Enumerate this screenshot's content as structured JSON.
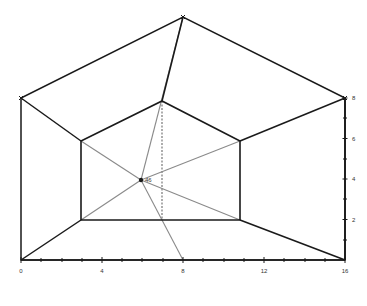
{
  "diagram": {
    "type": "perspective-pentagonal-frustum",
    "colors": {
      "stroke_main": "#1a1a1a",
      "stroke_guide": "#8a8a8a",
      "background": "#ffffff",
      "label": "#333333"
    },
    "outer_pentagon": [
      [
        21,
        260
      ],
      [
        21,
        98
      ],
      [
        183,
        17
      ],
      [
        345,
        98
      ],
      [
        345,
        260
      ]
    ],
    "inner_pentagon": [
      [
        81,
        220
      ],
      [
        81,
        141
      ],
      [
        162,
        101
      ],
      [
        240,
        141
      ],
      [
        240,
        220
      ]
    ],
    "center_point": {
      "x": 141,
      "y": 180,
      "label": "46"
    },
    "x_axis": {
      "y": 260,
      "x_start": 21,
      "x_end": 345,
      "tick_labels": [
        "0",
        "4",
        "8",
        "12",
        "16"
      ],
      "tick_label_positions": [
        21,
        102,
        183,
        264,
        345
      ],
      "minor_ticks": [
        41,
        62,
        82,
        122,
        142,
        163,
        203,
        224,
        244,
        284,
        305,
        325
      ]
    },
    "y_axis": {
      "x": 345,
      "y_start": 260,
      "y_end": 98,
      "tick_labels": [
        "2",
        "4",
        "6",
        "8"
      ],
      "tick_label_positions": [
        219.5,
        179,
        138.5,
        98
      ],
      "minor_ticks": [
        240,
        199,
        159,
        118
      ]
    },
    "guide_lines": [
      [
        [
          141,
          180
        ],
        [
          81,
          141
        ]
      ],
      [
        [
          141,
          180
        ],
        [
          240,
          141
        ]
      ],
      [
        [
          141,
          180
        ],
        [
          81,
          220
        ]
      ],
      [
        [
          141,
          180
        ],
        [
          240,
          220
        ]
      ],
      [
        [
          141,
          180
        ],
        [
          183,
          17
        ]
      ],
      [
        [
          141,
          180
        ],
        [
          183,
          260
        ]
      ]
    ],
    "dashed_line": [
      [
        162,
        101
      ],
      [
        162,
        220
      ]
    ]
  }
}
